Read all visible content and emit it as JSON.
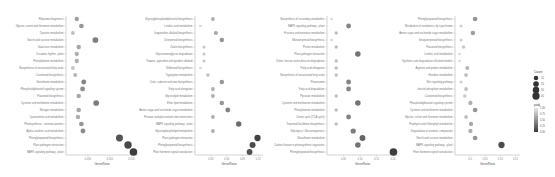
{
  "chart_data": [
    {
      "type": "scatter",
      "panel": 1,
      "xlabel": "GeneRatio",
      "xticks": [
        "0.050",
        "0.100",
        "0.150"
      ],
      "xlim": [
        0.02,
        0.19
      ],
      "categories": [
        "Ribosome biogenesis",
        "Glycine, serine and threonine metabolism",
        "Tyrosine metabolism",
        "Starch and sucrose metabolism",
        "Galactose metabolism",
        "Circadian rhythm - plant",
        "Phenylalanine metabolism",
        "Biosynthesis of unsaturated fatty acids",
        "Carotenoid biosynthesis",
        "Glutathione metabolism",
        "Phosphatidylinositol signaling system",
        "Flavonoid biosynthesis",
        "Cysteine and methionine metabolism",
        "Nitrogen metabolism",
        "Cyanoamino acid metabolism",
        "Photosynthesis - antenna proteins",
        "Alpha-Linolenic acid metabolism",
        "Phenylpropanoid biosynthesis",
        "Plant-pathogen interaction",
        "MAPK signaling pathway - plant"
      ],
      "x": [
        0.04,
        0.052,
        0.03,
        0.088,
        0.045,
        0.04,
        0.04,
        0.03,
        0.036,
        0.058,
        0.055,
        0.045,
        0.09,
        0.045,
        0.043,
        0.052,
        0.056,
        0.15,
        0.172,
        0.186
      ],
      "count": [
        6,
        8,
        4,
        14,
        7,
        6,
        6,
        4,
        5,
        9,
        9,
        7,
        14,
        7,
        7,
        8,
        9,
        24,
        28,
        30
      ],
      "padj": [
        0.6,
        0.55,
        0.8,
        0.4,
        0.65,
        0.7,
        0.7,
        0.85,
        0.75,
        0.45,
        0.5,
        0.65,
        0.4,
        0.65,
        0.7,
        0.55,
        0.5,
        0.15,
        0.08,
        0.02
      ]
    },
    {
      "type": "scatter",
      "panel": 2,
      "xlabel": "GeneRatio",
      "xticks": [
        "0.03",
        "0.06",
        "0.09",
        "0.12"
      ],
      "xlim": [
        0.0,
        0.125
      ],
      "categories": [
        "Glycosylphosphatidylinositol biosynthesis",
        "Linoleic acid metabolism",
        "Isoquinoline alkaloid biosynthesis",
        "Diterpenoid biosynthesis",
        "Zeatin biosynthesis",
        "Glycosaminoglycan degradation",
        "Tropane, piperidine and pyridine alkaloid",
        "Stilbenoid biosynthesis",
        "Tryptophan metabolism",
        "Cutin, suberine and wax biosynthesis",
        "Fatty acid elongation",
        "Glycerolipid metabolism",
        "Ether lipid metabolism",
        "Amino sugar and nucleotide sugar metabolism",
        "Pentose and glucuronate interconversions",
        "MAPK signaling pathway - plant",
        "Glycerophospholipid metabolism",
        "Plant-pathogen interaction",
        "Phenylpropanoid biosynthesis",
        "Plant hormone signal transduction"
      ],
      "x": [
        0.03,
        0.005,
        0.036,
        0.048,
        0.012,
        0.012,
        0.012,
        0.005,
        0.02,
        0.048,
        0.03,
        0.03,
        0.048,
        0.06,
        0.03,
        0.082,
        0.03,
        0.12,
        0.11,
        0.104
      ],
      "count": [
        4,
        1,
        5,
        7,
        2,
        2,
        2,
        1,
        3,
        7,
        4,
        4,
        7,
        9,
        4,
        12,
        4,
        18,
        16,
        15
      ],
      "padj": [
        0.7,
        0.95,
        0.65,
        0.55,
        0.85,
        0.85,
        0.85,
        0.95,
        0.8,
        0.55,
        0.7,
        0.7,
        0.55,
        0.45,
        0.7,
        0.3,
        0.7,
        0.05,
        0.1,
        0.15
      ]
    },
    {
      "type": "scatter",
      "panel": 3,
      "xlabel": "GeneRatio",
      "xticks": [
        "0.05",
        "0.10",
        "0.15",
        "0.20"
      ],
      "xlim": [
        0.0,
        0.21
      ],
      "categories": [
        "Biosynthesis of secondary metabolites",
        "MAPK signaling pathway - plant",
        "Fructose and mannose metabolism",
        "Monoterpenoid biosynthesis",
        "Purine metabolism",
        "Plant-pathogen interaction",
        "Valine, leucine and isoleucine degradation",
        "Fatty acid elongation",
        "Biosynthesis of unsaturated fatty acids",
        "Peroxisome",
        "Fatty acid degradation",
        "Pyruvate metabolism",
        "Cysteine and methionine metabolism",
        "Phenylalanine metabolism",
        "Citrate cycle (TCA cycle)",
        "Terpenoid backbone biosynthesis",
        "Glycolysis / Gluconeogenesis",
        "Glutathione metabolism",
        "Carbon fixation in photosynthetic organisms",
        "Phenylpropanoid biosynthesis"
      ],
      "x": [
        0.005,
        0.06,
        0.02,
        0.005,
        0.02,
        0.09,
        0.02,
        0.02,
        0.02,
        0.06,
        0.06,
        0.02,
        0.09,
        0.02,
        0.06,
        0.02,
        0.075,
        0.105,
        0.09,
        0.205
      ],
      "count": [
        1,
        9,
        3,
        1,
        3,
        13,
        3,
        3,
        3,
        9,
        9,
        3,
        13,
        3,
        9,
        3,
        11,
        15,
        13,
        30
      ],
      "padj": [
        0.95,
        0.45,
        0.8,
        0.95,
        0.8,
        0.35,
        0.8,
        0.8,
        0.8,
        0.45,
        0.45,
        0.8,
        0.35,
        0.8,
        0.45,
        0.8,
        0.4,
        0.25,
        0.35,
        0.02
      ]
    },
    {
      "type": "scatter",
      "panel": 4,
      "xlabel": "GeneRatio",
      "xticks": [
        "0.0",
        "0.05",
        "0.10",
        "0.15"
      ],
      "xlim": [
        0.0,
        0.19
      ],
      "categories": [
        "Phenylpropanoid biosynthesis",
        "Metabolism of xenobiotics by cytochrome",
        "Amino sugar and nucleotide sugar metabolism",
        "Sesquiterpenoid biosynthesis",
        "Flavonoid biosynthesis",
        "Linoleic acid metabolism",
        "Synthesis and degradation of ketone bodies",
        "Arginine and proline metabolism",
        "Histidine metabolism",
        "Wnt signaling pathway",
        "Inositol phosphate metabolism",
        "Carotenoid biosynthesis",
        "Phosphatidylinositol signaling system",
        "Cysteine and methionine metabolism",
        "Glycine, serine and threonine metabolism",
        "Porphyrin and chlorophyll metabolism",
        "Degradation of aromatic compounds",
        "Starch and sucrose metabolism",
        "MAPK signaling pathway - plant",
        "Plant hormone signal transduction"
      ],
      "x": [
        0.055,
        0.01,
        0.048,
        0.01,
        0.018,
        0.005,
        0.005,
        0.03,
        0.026,
        0.01,
        0.026,
        0.022,
        0.04,
        0.055,
        0.026,
        0.042,
        0.04,
        0.055,
        0.14,
        0.002
      ],
      "count": [
        8,
        2,
        7,
        2,
        3,
        1,
        1,
        5,
        4,
        2,
        4,
        3,
        6,
        8,
        4,
        6,
        6,
        8,
        18,
        0
      ],
      "padj": [
        0.55,
        0.9,
        0.6,
        0.9,
        0.85,
        0.95,
        0.95,
        0.75,
        0.8,
        0.9,
        0.8,
        0.85,
        0.7,
        0.55,
        0.8,
        0.65,
        0.7,
        0.55,
        0.1,
        0.99
      ]
    }
  ],
  "legend": {
    "count_title": "Count",
    "count_values": [
      "10",
      "20",
      "30",
      "40"
    ],
    "padj_title": "padj",
    "padj_ticks": [
      "1.00",
      "0.75",
      "0.50",
      "0.25",
      "0.00"
    ],
    "colors": {
      "low": "#3a3a3a",
      "high": "#e8e8e8"
    }
  }
}
